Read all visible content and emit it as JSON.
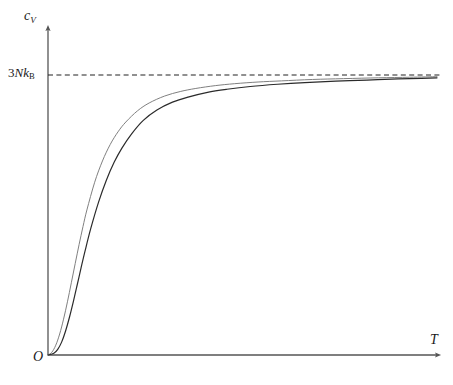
{
  "figure": {
    "background": "#ffffff",
    "axis_color": "#555555",
    "dashed_color": "#222222"
  },
  "labels": {
    "y_axis": "c",
    "y_axis_sub": "V",
    "x_axis": "T",
    "origin": "O",
    "asymptote_prefix": "3",
    "asymptote_mid": "Nk",
    "asymptote_sub": "B"
  },
  "chart_data": {
    "type": "line",
    "title": "",
    "xlabel": "T",
    "ylabel": "c_V",
    "grid": false,
    "legend": null,
    "xlim": [
      0,
      1
    ],
    "ylim": [
      0,
      1.08
    ],
    "annotations": [
      {
        "name": "asymptote",
        "text": "3Nk_B",
        "type": "hline",
        "y": 1.0,
        "style": "dashed"
      },
      {
        "name": "origin",
        "text": "O",
        "type": "point",
        "x": 0,
        "y": 0
      }
    ],
    "series": [
      {
        "name": "debye",
        "color": "#808080",
        "width": 1.0,
        "x": [
          0.0,
          0.01,
          0.02,
          0.03,
          0.04,
          0.05,
          0.06,
          0.07,
          0.08,
          0.09,
          0.1,
          0.12,
          0.14,
          0.16,
          0.18,
          0.2,
          0.23,
          0.26,
          0.3,
          0.34,
          0.38,
          0.43,
          0.48,
          0.54,
          0.6,
          0.68,
          0.76,
          0.85,
          0.93,
          1.0
        ],
        "y": [
          0.0,
          0.01,
          0.035,
          0.075,
          0.128,
          0.19,
          0.258,
          0.327,
          0.395,
          0.459,
          0.518,
          0.617,
          0.693,
          0.752,
          0.797,
          0.832,
          0.872,
          0.9,
          0.925,
          0.941,
          0.952,
          0.962,
          0.969,
          0.975,
          0.979,
          0.984,
          0.987,
          0.99,
          0.992,
          0.994
        ]
      },
      {
        "name": "einstein",
        "color": "#2b2b2b",
        "width": 1.2,
        "x": [
          0.0,
          0.015,
          0.025,
          0.035,
          0.045,
          0.055,
          0.065,
          0.075,
          0.085,
          0.095,
          0.11,
          0.13,
          0.15,
          0.17,
          0.19,
          0.215,
          0.245,
          0.28,
          0.32,
          0.36,
          0.41,
          0.46,
          0.52,
          0.59,
          0.66,
          0.74,
          0.82,
          0.9,
          0.96,
          1.0
        ],
        "y": [
          0.0,
          0.006,
          0.02,
          0.046,
          0.085,
          0.134,
          0.19,
          0.25,
          0.311,
          0.37,
          0.452,
          0.546,
          0.624,
          0.688,
          0.739,
          0.79,
          0.838,
          0.875,
          0.903,
          0.921,
          0.938,
          0.949,
          0.959,
          0.967,
          0.973,
          0.978,
          0.982,
          0.986,
          0.988,
          0.99
        ]
      }
    ]
  }
}
